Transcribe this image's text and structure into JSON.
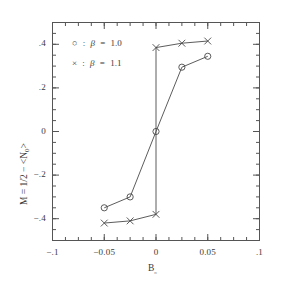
{
  "chart_data": {
    "type": "line",
    "title": "",
    "xlabel": "B₀",
    "ylabel": "M = 1/2 − <N₀>",
    "xlim": [
      -0.1,
      0.1
    ],
    "ylim": [
      -0.5,
      0.5
    ],
    "grid": false,
    "legend_position": "upper-left-inside",
    "xticks": [
      -0.1,
      -0.05,
      0,
      0.05,
      0.1
    ],
    "xtick_labels": [
      "−.1",
      "−0.05",
      "0",
      "0.05",
      ".1"
    ],
    "yticks": [
      0.4,
      0.2,
      0,
      -0.2,
      -0.4
    ],
    "ytick_labels": [
      ".4",
      ".2",
      "0",
      "−.2",
      "−.4"
    ],
    "x_minor_tick_interval": 0.0125,
    "y_minor_tick_interval": 0.05,
    "series": [
      {
        "name": "β = 1.0",
        "marker": "circle",
        "legend_symbol": "○",
        "legend_text": "○  :  β  =  1.0",
        "beta": "1.0",
        "x": [
          -0.05,
          -0.025,
          0.0,
          0.025,
          0.05
        ],
        "y": [
          -0.35,
          -0.3,
          0.0,
          0.295,
          0.345
        ]
      },
      {
        "name": "β = 1.1",
        "marker": "cross",
        "legend_symbol": "×",
        "legend_text": "×  :  β  =  1.1",
        "beta": "1.1",
        "x": [
          -0.05,
          -0.025,
          0.0,
          0.0,
          0.025,
          0.05
        ],
        "y": [
          -0.42,
          -0.41,
          -0.38,
          0.385,
          0.405,
          0.415
        ]
      }
    ]
  },
  "axes": {
    "x_label_text": "B",
    "x_label_sub": "₀",
    "y_label_text": "M  =  1/2  −  <N",
    "y_label_sub": "0",
    "y_label_tail": ">"
  },
  "legend": {
    "items": [
      {
        "symbol": "○",
        "sep": ":",
        "param": "β",
        "eq": "=",
        "value": "1.0"
      },
      {
        "symbol": "×",
        "sep": ":",
        "param": "β",
        "eq": "=",
        "value": "1.1"
      }
    ]
  },
  "style": {
    "line_color": "#4a4a4a",
    "axis_color": "#555555",
    "background": "#ffffff"
  }
}
